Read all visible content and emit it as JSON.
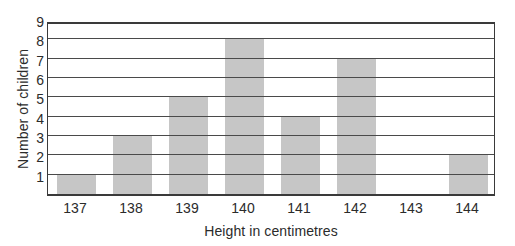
{
  "chart_data": {
    "type": "bar",
    "title": "",
    "xlabel": "Height in centimetres",
    "ylabel": "Number of children",
    "categories": [
      "137",
      "138",
      "139",
      "140",
      "141",
      "142",
      "143",
      "144"
    ],
    "values": [
      1,
      3,
      5,
      8,
      4,
      7,
      0,
      2
    ],
    "ylim": [
      0,
      9
    ],
    "yticks": [
      "1",
      "2",
      "3",
      "4",
      "5",
      "6",
      "7",
      "8",
      "9"
    ],
    "grid": "horizontal",
    "legend": "none",
    "bar_color": "#c6c6c6",
    "axis_color": "#3a3a3a",
    "background": "#ffffff"
  }
}
